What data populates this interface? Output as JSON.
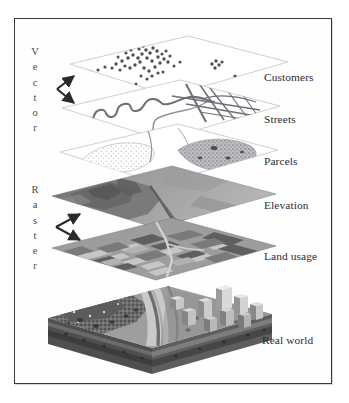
{
  "figure": {
    "kind": "gis-layer-stack-diagram",
    "border_color": "#3a3a44",
    "background": "#ffffff"
  },
  "categories": [
    {
      "id": "vector",
      "label": "Vector",
      "letters": [
        "V",
        "e",
        "c",
        "t",
        "o",
        "r"
      ],
      "covers": [
        "Customers",
        "Streets",
        "Parcels"
      ],
      "arrow": "double-headed"
    },
    {
      "id": "raster",
      "label": "Raster",
      "letters": [
        "R",
        "a",
        "s",
        "t",
        "e",
        "r"
      ],
      "covers": [
        "Elevation",
        "Land usage"
      ],
      "arrow": "double-headed"
    }
  ],
  "layers": [
    {
      "id": "customers",
      "label": "Customers",
      "geometry": "point",
      "group": "Vector",
      "fill": "#ffffff"
    },
    {
      "id": "streets",
      "label": "Streets",
      "geometry": "line",
      "group": "Vector",
      "fill": "#ffffff"
    },
    {
      "id": "parcels",
      "label": "Parcels",
      "geometry": "polygon",
      "group": "Vector",
      "fill": "#ffffff"
    },
    {
      "id": "elevation",
      "label": "Elevation",
      "geometry": "raster",
      "group": "Raster",
      "fill": "#9a9a9a"
    },
    {
      "id": "landusage",
      "label": "Land usage",
      "geometry": "raster",
      "group": "Raster",
      "fill": "#8e8e8e"
    },
    {
      "id": "realworld",
      "label": "Real world",
      "geometry": "3d-block",
      "group": "",
      "fill": "#8b8b8b"
    }
  ],
  "colors": {
    "ink": "#2c2c30",
    "category_ink": "#4a4a50",
    "plane_edge": "#c9c9cf",
    "point_marker": "#4f4f57",
    "street_line": "#6e6e78",
    "elevation_light": "#a8a8a8",
    "elevation_dark": "#6f6f6f",
    "land_light": "#c6c6c6",
    "land_mid": "#9d9d9d",
    "land_dark": "#5f5f5f",
    "block_top": "#9e9e9e",
    "block_side": "#5a5a5a",
    "water": "#d6d6d6",
    "buildings": "#cfcfcf"
  }
}
